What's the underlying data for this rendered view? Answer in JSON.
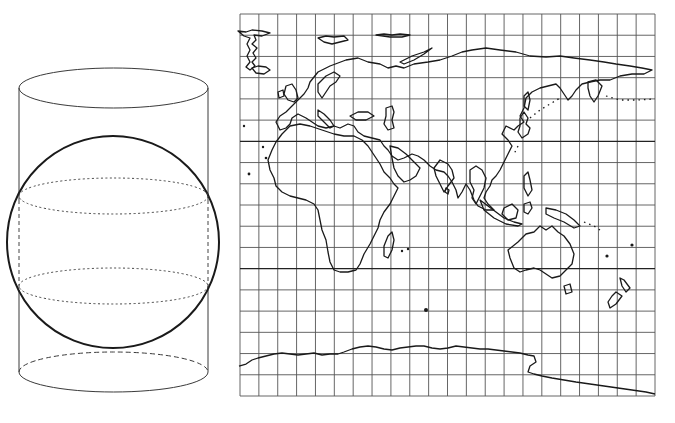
{
  "figure": {
    "left_panel": {
      "label": "Secant cylindrical projection: cylinder intersecting sphere along two standard parallels",
      "cylinder": {
        "left_x": 19,
        "right_x": 208,
        "top_y": 88,
        "bottom_y": 370,
        "ellipse_ry": 20
      },
      "sphere": {
        "cx": 113,
        "cy": 242,
        "r": 106
      },
      "standard_parallels_y": [
        196,
        286
      ]
    },
    "right_panel": {
      "label": "World map on cylindrical projection with graticule",
      "grid": {
        "x0": 240,
        "x1": 655,
        "y0": 14,
        "y1": 396,
        "columns": 22,
        "rows": 18,
        "major_rows_y": [
          142,
          270
        ]
      },
      "regions_visible": [
        "Greenland",
        "Europe",
        "Asia",
        "Africa",
        "Madagascar",
        "Arabian Peninsula",
        "India",
        "Japan",
        "Indonesia",
        "Australia",
        "New Zealand",
        "Antarctica"
      ]
    },
    "colors": {
      "background": "#ffffff",
      "line": "#1a1a1a",
      "grid": "#555555"
    }
  }
}
